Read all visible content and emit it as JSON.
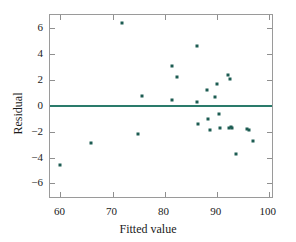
{
  "chart_data": {
    "type": "scatter",
    "title": "",
    "xlabel": "Fitted value",
    "ylabel": "Residual",
    "xlim": [
      58,
      101
    ],
    "ylim": [
      -7.2,
      7.0
    ],
    "xticks": [
      60,
      70,
      80,
      90,
      100
    ],
    "yticks": [
      6,
      4,
      2,
      0,
      -2,
      -4,
      -6
    ],
    "xtick_labels": [
      "60",
      "70",
      "80",
      "90",
      "100"
    ],
    "ytick_labels": [
      "6",
      "4",
      "2",
      "0",
      "−2",
      "−4",
      "−6"
    ],
    "grid": false,
    "legend": null,
    "reference_line": {
      "name": "zero-residual-line",
      "orientation": "horizontal",
      "y": 0,
      "color": "#2a7b6b"
    },
    "marker_color": "#1d5c52",
    "frame_color": "#9a9a9a",
    "series": [
      {
        "name": "residuals",
        "x": [
          59.9,
          65.8,
          71.9,
          74.9,
          75.6,
          81.4,
          81.5,
          82.4,
          86.2,
          86.3,
          86.4,
          88.2,
          88.4,
          88.7,
          89.6,
          90.0,
          90.4,
          90.6,
          92.1,
          92.4,
          92.6,
          92.7,
          93.0,
          93.8,
          95.9,
          96.2,
          96.9
        ],
        "y": [
          -4.6,
          -2.85,
          6.35,
          -2.2,
          0.72,
          3.05,
          0.42,
          2.25,
          4.6,
          0.3,
          -1.45,
          1.2,
          -1.0,
          -1.85,
          0.7,
          1.7,
          -0.65,
          -1.75,
          2.35,
          -1.7,
          2.05,
          -1.65,
          -1.75,
          -3.75,
          -1.8,
          -1.85,
          -2.7
        ]
      }
    ]
  }
}
